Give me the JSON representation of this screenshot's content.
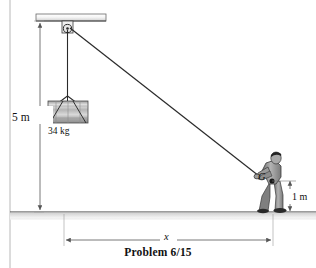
{
  "figure": {
    "caption": "Problem 6/15",
    "title_hidden": "",
    "labels": {
      "height_5m": "5 m",
      "mass": "34 kg",
      "height_1m": "1 m",
      "distance_x": "x",
      "center_of_gravity": "G"
    },
    "colors": {
      "line": "#1a1a1a",
      "dimension_line": "#555555",
      "ground_fill": "#d8d8d8",
      "beam_fill": "#f2f2f2",
      "drum_fill": "#b9b9b9",
      "person_fill": "#8a8a8a",
      "border": "#9a9a9a",
      "background": "#ffffff"
    },
    "geometry": {
      "ceiling_y": 20,
      "ground_y": 212,
      "pulley": {
        "x": 68,
        "y": 29
      },
      "drum": {
        "x": 48,
        "y": 101,
        "width": 40,
        "height": 22
      },
      "person_hand": {
        "x": 258,
        "y": 176
      },
      "cg_point": {
        "x": 272,
        "y": 181
      },
      "x_dimension": {
        "from": 64,
        "to": 273,
        "y": 240
      },
      "five_m_dimension": {
        "x": 40,
        "from_y": 21,
        "to_y": 212
      },
      "one_m_dimension": {
        "x": 290,
        "from_y": 181,
        "to_y": 212
      }
    },
    "icons": {
      "pulley": "pulley-icon",
      "drum": "drum-mass-icon",
      "person": "person-pulling-icon",
      "ground": "ground-hatch-icon"
    }
  }
}
